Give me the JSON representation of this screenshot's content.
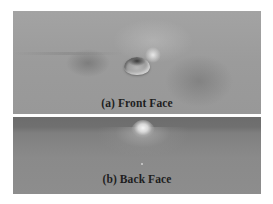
{
  "figure": {
    "panels": [
      {
        "id": "front",
        "caption": "(a) Front Face",
        "description": "Gray surface with a single raised transparent droplet/blister near the center, light highlight above-right"
      },
      {
        "id": "back",
        "caption": "(b) Back Face",
        "description": "Gray surface viewed edge-on with a bright conical bump protruding at the top center"
      }
    ]
  }
}
